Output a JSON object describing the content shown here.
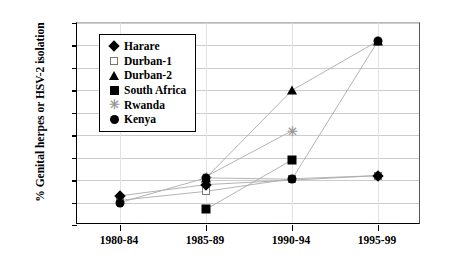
{
  "chart_data": {
    "type": "line",
    "title": "",
    "xlabel": "",
    "ylabel": "% Genital herpes or HSV-2 isolation",
    "categories": [
      "1980-84",
      "1985-89",
      "1990-94",
      "1995-99"
    ],
    "ylim": [
      0,
      45
    ],
    "ytick_step": 5,
    "yticks": [
      "45",
      "40",
      "35",
      "30",
      "25",
      "20",
      "15",
      "10",
      "5",
      "0"
    ],
    "grid": "horizontal",
    "legend_position": "upper-left-inside",
    "series": [
      {
        "name": "Harare",
        "marker": "filled-diamond",
        "color": "#000000",
        "values": [
          6.5,
          9.0,
          null,
          11.0
        ]
      },
      {
        "name": "Durban-1",
        "marker": "open-square",
        "color": "#777777",
        "values": [
          5.5,
          7.5,
          10.3,
          11.0
        ]
      },
      {
        "name": "Durban-2",
        "marker": "filled-triangle",
        "color": "#000000",
        "values": [
          null,
          10.5,
          30.0,
          41.0
        ]
      },
      {
        "name": "South Africa",
        "marker": "filled-square",
        "color": "#000000",
        "values": [
          null,
          3.5,
          14.5,
          null
        ]
      },
      {
        "name": "Rwanda",
        "marker": "star-x",
        "color": "#9a9a9a",
        "values": [
          null,
          10.8,
          21.0,
          null
        ]
      },
      {
        "name": "Kenya",
        "marker": "filled-circle",
        "color": "#000000",
        "values": [
          5.0,
          10.5,
          10.2,
          41.0
        ]
      }
    ]
  },
  "legend": {
    "items": [
      {
        "label": "Harare",
        "marker": "filled-diamond"
      },
      {
        "label": "Durban-1",
        "marker": "open-square"
      },
      {
        "label": "Durban-2",
        "marker": "filled-triangle"
      },
      {
        "label": "South Africa",
        "marker": "filled-square"
      },
      {
        "label": "Rwanda",
        "marker": "star-x"
      },
      {
        "label": "Kenya",
        "marker": "filled-circle"
      }
    ]
  }
}
